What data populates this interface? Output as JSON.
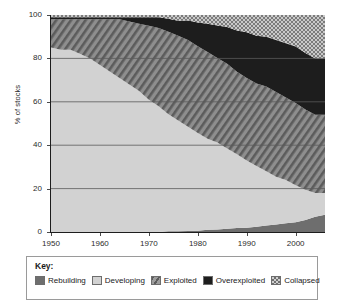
{
  "chart_data": {
    "type": "area",
    "stacked": true,
    "title": "",
    "xlabel": "",
    "ylabel": "% of stocks",
    "xlim": [
      1950,
      2006
    ],
    "ylim": [
      0,
      100
    ],
    "grid": true,
    "grid_axis": "y",
    "legend_position": "bottom",
    "legend_title": "Key:",
    "x_ticks": [
      1950,
      1960,
      1970,
      1980,
      1990,
      2000
    ],
    "y_ticks": [
      0,
      20,
      40,
      60,
      80,
      100
    ],
    "x": [
      1950,
      1952,
      1954,
      1956,
      1958,
      1960,
      1962,
      1964,
      1966,
      1968,
      1970,
      1972,
      1974,
      1976,
      1978,
      1980,
      1982,
      1984,
      1986,
      1988,
      1990,
      1992,
      1994,
      1996,
      1998,
      2000,
      2002,
      2004,
      2006
    ],
    "series": [
      {
        "name": "Rebuilding",
        "color": "#6e6e6e",
        "pattern": "solid",
        "values": [
          0,
          0,
          0,
          0,
          0,
          0,
          0,
          0,
          0,
          0,
          0,
          0,
          0.3,
          0.4,
          0.5,
          0.6,
          1.0,
          1.2,
          1.5,
          1.8,
          2.0,
          2.4,
          3.0,
          3.5,
          4.0,
          4.5,
          5.5,
          7.0,
          8.0
        ]
      },
      {
        "name": "Developing",
        "color": "#d2d2d2",
        "pattern": "solid",
        "values": [
          85,
          84,
          84,
          82,
          80,
          77,
          74,
          71,
          68,
          65,
          61,
          58,
          54,
          51,
          48,
          45,
          42,
          40,
          37,
          34,
          31,
          28,
          25,
          22,
          20,
          17,
          14,
          11,
          10
        ]
      },
      {
        "name": "Exploited",
        "color": "#8e8e8e",
        "pattern": "diagonal-hatch",
        "values": [
          13,
          14,
          14,
          16,
          18,
          21,
          24,
          27,
          29,
          31,
          34,
          36,
          38,
          39,
          40,
          40,
          40,
          39,
          39,
          38,
          38,
          38,
          39,
          39,
          38,
          38,
          37,
          36,
          36
        ]
      },
      {
        "name": "Overexploited",
        "color": "#1d1d1d",
        "pattern": "solid",
        "values": [
          1,
          1,
          1,
          1,
          1,
          1,
          1,
          1,
          2,
          3,
          4,
          5,
          6,
          7,
          9,
          11,
          13,
          15,
          17,
          19,
          21,
          22,
          23,
          24,
          25,
          26,
          26,
          26,
          26
        ]
      },
      {
        "name": "Collapsed",
        "color": "#a8a8a8",
        "pattern": "checker",
        "values": [
          1,
          1,
          1,
          1,
          1,
          1,
          1,
          1,
          1,
          1,
          1,
          1,
          1.7,
          2.6,
          2.5,
          3.4,
          4,
          4.8,
          5.5,
          7.2,
          8,
          9.6,
          10,
          11.5,
          13,
          14.5,
          17.5,
          20,
          20
        ]
      }
    ]
  },
  "legend": {
    "title": "Key:",
    "items": [
      {
        "label": "Rebuilding",
        "swatch": "rebuilding-swatch"
      },
      {
        "label": "Developing",
        "swatch": "developing-swatch"
      },
      {
        "label": "Exploited",
        "swatch": "exploited-swatch"
      },
      {
        "label": "Overexploited",
        "swatch": "overexploited-swatch"
      },
      {
        "label": "Collapsed",
        "swatch": "collapsed-swatch"
      }
    ]
  }
}
